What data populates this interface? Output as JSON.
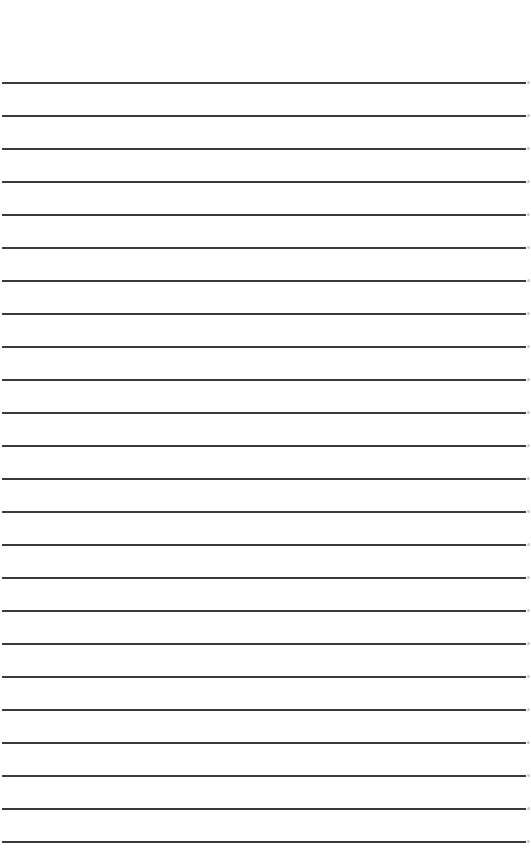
{
  "page": {
    "type": "lined-paper",
    "background_color": "#ffffff",
    "line_color": "#3a3a3a",
    "line_count": 24,
    "first_line_y": 82,
    "line_spacing": 33
  }
}
